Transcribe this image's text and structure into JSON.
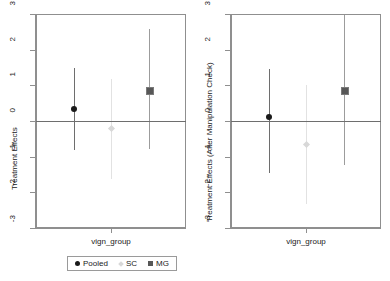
{
  "chart_data": {
    "type": "scatter",
    "title": "",
    "panels": [
      {
        "name": "panel-left",
        "ylabel": "Treatment Effects",
        "xlabel": "vign_group",
        "ylim": [
          -3,
          3
        ],
        "yticks": [
          3,
          2,
          1,
          0,
          -1,
          -2,
          -3
        ],
        "ytick_labels": [
          "3",
          "2",
          "1",
          "0",
          "-1",
          "-2",
          "-3"
        ],
        "grid": false,
        "zero_reference_line": 0,
        "points": [
          {
            "group": "Pooled",
            "x": 1,
            "estimate": 0.33,
            "ci_low": -0.82,
            "ci_high": 1.5,
            "marker": "circle",
            "color": "#1a1a1a"
          },
          {
            "group": "SC",
            "x": 2,
            "estimate": -0.22,
            "ci_low": -1.62,
            "ci_high": 1.18,
            "marker": "diamond",
            "color": "#d8d8d8"
          },
          {
            "group": "MG",
            "x": 3,
            "estimate": 0.88,
            "ci_low": -0.78,
            "ci_high": 2.58,
            "marker": "square",
            "color": "#575757"
          }
        ]
      },
      {
        "name": "panel-right",
        "ylabel": "Treatment Effects (After Manipulation Check)",
        "xlabel": "vign_group",
        "ylim": [
          -3,
          3
        ],
        "yticks": [
          3,
          2,
          1,
          0,
          -1,
          -2,
          -3
        ],
        "ytick_labels": [
          "3",
          "2",
          "1",
          "0",
          "-1",
          "-2",
          "-3"
        ],
        "grid": false,
        "zero_reference_line": 0,
        "points": [
          {
            "group": "Pooled",
            "x": 1,
            "estimate": 0.11,
            "ci_low": -1.45,
            "ci_high": 1.45,
            "marker": "circle",
            "color": "#1a1a1a"
          },
          {
            "group": "SC",
            "x": 2,
            "estimate": -0.66,
            "ci_low": -2.33,
            "ci_high": 1.0,
            "marker": "diamond",
            "color": "#d8d8d8"
          },
          {
            "group": "MG",
            "x": 3,
            "estimate": 0.87,
            "ci_low": -1.22,
            "ci_high": 2.98,
            "marker": "square",
            "color": "#575757"
          }
        ]
      }
    ],
    "legend": {
      "position": "bottom-center",
      "entries": [
        {
          "label": "Pooled",
          "marker": "circle",
          "color": "#1a1a1a"
        },
        {
          "label": "SC",
          "marker": "diamond",
          "color": "#d8d8d8"
        },
        {
          "label": "MG",
          "marker": "square",
          "color": "#575757"
        }
      ]
    }
  },
  "panel_left": {
    "ylabel": "Treatment Effects",
    "xlabel": "vign_group",
    "ytick_labels": [
      "3",
      "2",
      "1",
      "0",
      "-1",
      "-2",
      "-3"
    ]
  },
  "panel_right": {
    "ylabel": "Treatment Effects (After Manipulation Check)",
    "xlabel": "vign_group",
    "ytick_labels": [
      "3",
      "2",
      "1",
      "0",
      "-1",
      "-2",
      "-3"
    ]
  },
  "legend": {
    "pooled_label": "Pooled",
    "sc_label": "SC",
    "mg_label": "MG"
  },
  "colors": {
    "pooled": "#1a1a1a",
    "sc": "#d8d8d8",
    "mg": "#575757",
    "axis": "#8f8f8f",
    "zero_line": "#6e6e6e",
    "background": "#ffffff"
  }
}
